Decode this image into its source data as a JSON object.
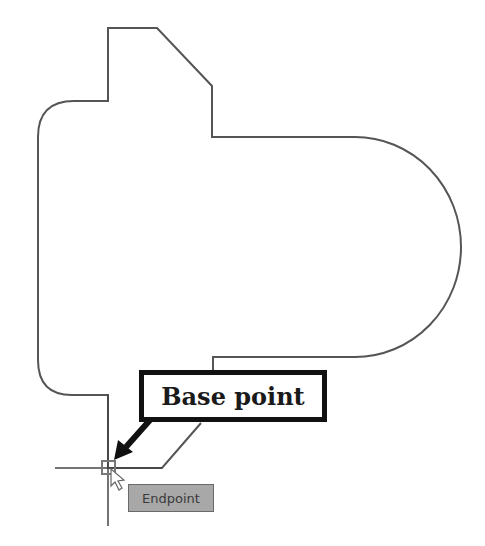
{
  "diagram": {
    "callout": {
      "label": "Base point",
      "color": "#111111"
    },
    "snap_tooltip": {
      "label": "Endpoint",
      "background": "#a8a8a8"
    },
    "outline_color": "#555555",
    "crosshair_color": "#444444",
    "snap_marker_color": "#777777",
    "icons": [
      "endpoint-snap-marker-icon",
      "cursor-arrow-icon",
      "crosshair-icon",
      "callout-arrow-icon"
    ]
  }
}
